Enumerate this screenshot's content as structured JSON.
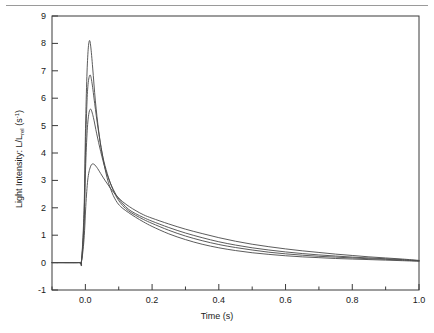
{
  "figure": {
    "background_color": "#ffffff",
    "frame_color": "#3a3a3a",
    "rule_color": "#9a9a9a",
    "curve_color": "#4a4a4a"
  },
  "chart_data": {
    "type": "line",
    "title": "",
    "xlabel": "Time (s)",
    "ylabel_main": "Light Intensity:  L/L",
    "ylabel_sub": "rel",
    "ylabel_units_base": " (s",
    "ylabel_units_exp": "-1",
    "ylabel_units_close": ")",
    "xlim": [
      -0.1,
      1.0
    ],
    "ylim": [
      -1,
      9
    ],
    "grid": false,
    "legend": "none",
    "x_major_ticks": [
      0.0,
      0.2,
      0.4,
      0.6,
      0.8,
      1.0
    ],
    "x_major_tick_labels": [
      "0.0",
      "0.2",
      "0.4",
      "0.6",
      "0.8",
      "1.0"
    ],
    "x_minor_ticks": [
      -0.1,
      0.1,
      0.3,
      0.5,
      0.7,
      0.9
    ],
    "y_major_ticks": [
      -1,
      0,
      1,
      2,
      3,
      4,
      5,
      6,
      7,
      8,
      9
    ],
    "y_major_tick_labels": [
      "-1",
      "0",
      "1",
      "2",
      "3",
      "4",
      "5",
      "6",
      "7",
      "8",
      "9"
    ],
    "series": [
      {
        "name": "curve-1-peak-8.1",
        "peak_value": 8.1,
        "peak_time": 0.012,
        "x": [
          -0.1,
          -0.02,
          -0.012,
          -0.004,
          0.0,
          0.004,
          0.008,
          0.012,
          0.016,
          0.022,
          0.03,
          0.04,
          0.05,
          0.065,
          0.08,
          0.095,
          0.11,
          0.13,
          0.15,
          0.175,
          0.2,
          0.25,
          0.3,
          0.35,
          0.4,
          0.45,
          0.5,
          0.55,
          0.6,
          0.65,
          0.7,
          0.75,
          0.8,
          0.85,
          0.9,
          0.95,
          1.0
        ],
        "y": [
          0.0,
          0.0,
          0.02,
          1.9,
          4.6,
          6.6,
          7.7,
          8.1,
          7.9,
          7.1,
          5.9,
          4.8,
          4.0,
          3.1,
          2.55,
          2.2,
          2.0,
          1.82,
          1.66,
          1.48,
          1.32,
          1.05,
          0.84,
          0.67,
          0.54,
          0.44,
          0.36,
          0.3,
          0.25,
          0.21,
          0.18,
          0.15,
          0.13,
          0.11,
          0.09,
          0.07,
          0.05
        ]
      },
      {
        "name": "curve-2-peak-6.85",
        "peak_value": 6.85,
        "peak_time": 0.014,
        "x": [
          -0.1,
          -0.02,
          -0.012,
          -0.004,
          0.0,
          0.004,
          0.008,
          0.014,
          0.02,
          0.028,
          0.038,
          0.05,
          0.062,
          0.078,
          0.095,
          0.112,
          0.13,
          0.15,
          0.175,
          0.2,
          0.25,
          0.3,
          0.35,
          0.4,
          0.45,
          0.5,
          0.55,
          0.6,
          0.65,
          0.7,
          0.75,
          0.8,
          0.85,
          0.9,
          0.95,
          1.0
        ],
        "y": [
          0.0,
          0.0,
          0.02,
          1.6,
          3.9,
          5.6,
          6.5,
          6.85,
          6.55,
          5.8,
          4.9,
          4.0,
          3.4,
          2.8,
          2.36,
          2.08,
          1.88,
          1.73,
          1.57,
          1.43,
          1.18,
          0.97,
          0.8,
          0.66,
          0.55,
          0.46,
          0.38,
          0.32,
          0.27,
          0.23,
          0.2,
          0.17,
          0.14,
          0.12,
          0.09,
          0.06
        ]
      },
      {
        "name": "curve-3-peak-5.6",
        "peak_value": 5.6,
        "peak_time": 0.016,
        "x": [
          -0.1,
          -0.02,
          -0.012,
          -0.004,
          0.0,
          0.005,
          0.01,
          0.016,
          0.024,
          0.034,
          0.046,
          0.06,
          0.075,
          0.092,
          0.11,
          0.13,
          0.15,
          0.175,
          0.2,
          0.25,
          0.3,
          0.35,
          0.4,
          0.45,
          0.5,
          0.55,
          0.6,
          0.65,
          0.7,
          0.75,
          0.8,
          0.85,
          0.9,
          0.95,
          1.0
        ],
        "y": [
          0.0,
          0.0,
          0.02,
          1.3,
          3.2,
          4.7,
          5.4,
          5.6,
          5.3,
          4.7,
          4.05,
          3.4,
          2.9,
          2.48,
          2.18,
          1.94,
          1.79,
          1.64,
          1.51,
          1.28,
          1.08,
          0.91,
          0.76,
          0.64,
          0.54,
          0.46,
          0.39,
          0.33,
          0.28,
          0.24,
          0.2,
          0.17,
          0.14,
          0.11,
          0.07
        ]
      },
      {
        "name": "curve-4-peak-3.6",
        "peak_value": 3.6,
        "peak_time": 0.024,
        "x": [
          -0.1,
          -0.02,
          -0.012,
          -0.004,
          0.002,
          0.008,
          0.016,
          0.024,
          0.034,
          0.046,
          0.06,
          0.076,
          0.094,
          0.112,
          0.132,
          0.152,
          0.175,
          0.2,
          0.25,
          0.3,
          0.35,
          0.4,
          0.45,
          0.5,
          0.55,
          0.6,
          0.65,
          0.7,
          0.75,
          0.8,
          0.85,
          0.9,
          0.95,
          1.0
        ],
        "y": [
          0.0,
          0.0,
          0.02,
          0.85,
          2.2,
          3.1,
          3.52,
          3.6,
          3.48,
          3.25,
          2.98,
          2.7,
          2.43,
          2.22,
          2.04,
          1.89,
          1.74,
          1.62,
          1.41,
          1.22,
          1.06,
          0.91,
          0.78,
          0.67,
          0.58,
          0.5,
          0.43,
          0.37,
          0.31,
          0.26,
          0.21,
          0.17,
          0.13,
          0.08
        ]
      }
    ]
  }
}
